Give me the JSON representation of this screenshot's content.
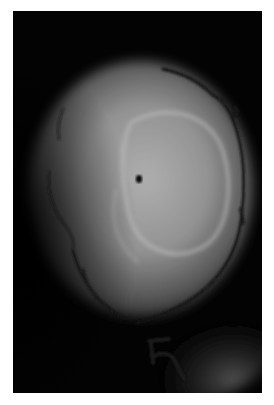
{
  "image": {
    "description": "Grayscale photograph of a back-illuminated rounded specimen outlined with dark marker, with a small dark dot near center and a handwritten letter below",
    "background_color": "#ffffff",
    "frame_color": "#050505",
    "specimen_colors": {
      "center": "#b4b4b4",
      "mid": "#8e8e8e",
      "edge": "#3a3a3a"
    },
    "inner_ring_color": "#c4c4c4",
    "marker_color": "#1a1a1a",
    "dot_color": "#0c0c0c",
    "annotations": {
      "letter": "R"
    }
  }
}
